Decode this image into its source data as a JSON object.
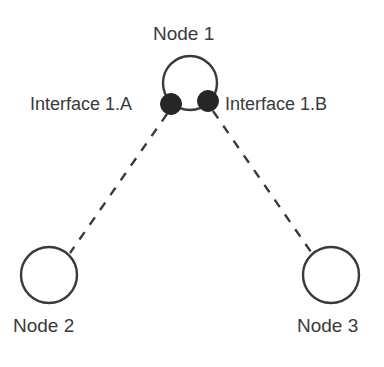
{
  "diagram": {
    "background_color": "#ffffff",
    "stroke_color": "#3a3a3a",
    "dot_fill_color": "#262626",
    "nodes": [
      {
        "id": "node-1",
        "label": "Node 1",
        "shape": "circle",
        "cx": 190,
        "cy": 83,
        "r": 27,
        "label_position": "above"
      },
      {
        "id": "node-2",
        "label": "Node 2",
        "shape": "circle",
        "cx": 49,
        "cy": 275,
        "r": 28,
        "label_position": "below"
      },
      {
        "id": "node-3",
        "label": "Node 3",
        "shape": "circle",
        "cx": 331,
        "cy": 275,
        "r": 28,
        "label_position": "below"
      }
    ],
    "interfaces": [
      {
        "id": "interface-1a",
        "label": "Interface 1.A",
        "parent_node": "node-1",
        "cx": 171,
        "cy": 104,
        "r": 10,
        "label_position": "left"
      },
      {
        "id": "interface-1b",
        "label": "Interface 1.B",
        "parent_node": "node-1",
        "cx": 208,
        "cy": 101,
        "r": 10,
        "label_position": "right"
      }
    ],
    "links": [
      {
        "id": "link-1a-to-node-2",
        "from": "interface-1a",
        "to": "node-2",
        "style": "dashed",
        "x1": 167,
        "y1": 114,
        "x2": 70,
        "y2": 253
      },
      {
        "id": "link-1b-to-node-3",
        "from": "interface-1b",
        "to": "node-3",
        "style": "dashed",
        "x1": 213,
        "y1": 111,
        "x2": 311,
        "y2": 252
      }
    ]
  }
}
